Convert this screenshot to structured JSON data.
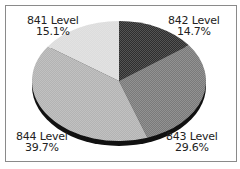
{
  "chart_data": {
    "type": "pie",
    "title": "",
    "style": "3d",
    "categories": [
      "842 Level",
      "843 Level",
      "844 Level",
      "841 Level"
    ],
    "values": [
      14.7,
      29.6,
      39.7,
      15.1
    ],
    "unit": "%",
    "start_angle": "12 o'clock",
    "direction": "clockwise",
    "colors": [
      "#2e2e2e",
      "#7a7a7a",
      "#b3b3b3",
      "#dcdcdc"
    ],
    "legend": "none (direct labels)"
  },
  "labels": {
    "l842": {
      "name": "842 Level",
      "pct": "14.7%"
    },
    "l843": {
      "name": "843 Level",
      "pct": "29.6%"
    },
    "l844": {
      "name": "844 Level",
      "pct": "39.7%"
    },
    "l841": {
      "name": "841 Level",
      "pct": "15.1%"
    }
  }
}
